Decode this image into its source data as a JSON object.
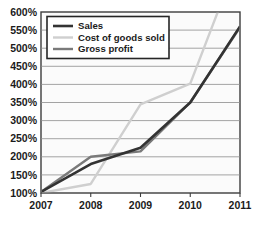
{
  "chart_data": {
    "type": "line",
    "title": "",
    "xlabel": "",
    "ylabel": "",
    "x": [
      2007,
      2008,
      2009,
      2010,
      2011
    ],
    "categories": [
      "2007",
      "2008",
      "2009",
      "2010",
      "2011"
    ],
    "xtick_labels": [
      "2007",
      "2008",
      "2009",
      "2010",
      "2011"
    ],
    "ytick_labels": [
      "100%",
      "150%",
      "200%",
      "250%",
      "300%",
      "350%",
      "400%",
      "450%",
      "500%",
      "550%",
      "600%"
    ],
    "ytick_values": [
      100,
      150,
      200,
      250,
      300,
      350,
      400,
      450,
      500,
      550,
      600
    ],
    "ylim": [
      100,
      600
    ],
    "xlim": [
      2007,
      2011
    ],
    "grid": true,
    "legend_position": "top-left",
    "series": [
      {
        "name": "Sales",
        "color": "#333333",
        "width": 2.6,
        "values": [
          103,
          180,
          225,
          350,
          560
        ],
        "clipped_at_top": false
      },
      {
        "name": "Cost of goods sold",
        "color": "#cfcfcf",
        "width": 2.4,
        "values": [
          100,
          125,
          345,
          402,
          760
        ],
        "clipped_at_top": true,
        "note": "Exits top of plot area between 2010 and 2011"
      },
      {
        "name": "Gross profit",
        "color": "#7a7a7a",
        "width": 2.4,
        "values": [
          103,
          200,
          215,
          350,
          558
        ],
        "clipped_at_top": false
      }
    ]
  },
  "legend": {
    "entries": [
      {
        "label": "Sales"
      },
      {
        "label": "Cost of goods sold"
      },
      {
        "label": "Gross profit"
      }
    ]
  },
  "axes": {
    "y_labels": [
      "600%",
      "550%",
      "500%",
      "450%",
      "400%",
      "350%",
      "300%",
      "250%",
      "200%",
      "150%",
      "100%"
    ],
    "x_labels": [
      "2007",
      "2008",
      "2009",
      "2010",
      "2011"
    ]
  },
  "colors": {
    "sales": "#333333",
    "cost_of_goods_sold": "#cfcfcf",
    "gross_profit": "#7a7a7a",
    "gridline": "#8d8d8d",
    "border": "#3d3d3d",
    "plot_background": "#fbfbfb",
    "text": "#1b1b1b"
  }
}
